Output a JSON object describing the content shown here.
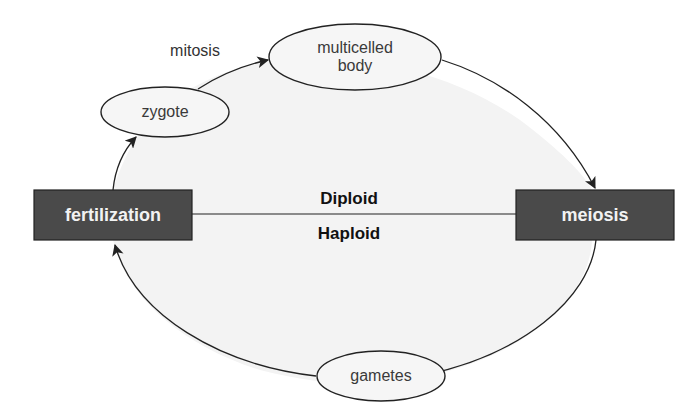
{
  "diagram": {
    "colors": {
      "background": "#ffffff",
      "cycle_fill": "#f3f3f3",
      "box_fill": "#4a4a4a",
      "box_text": "#f2f2f2",
      "line": "#222222",
      "node_fill": "#f6f6f6"
    },
    "nodes": [
      {
        "id": "zygote",
        "label": "zygote",
        "shape": "ellipse"
      },
      {
        "id": "multicelled_body",
        "label": "multicelled\nbody",
        "line1": "multicelled",
        "line2": "body",
        "shape": "ellipse"
      },
      {
        "id": "gametes",
        "label": "gametes",
        "shape": "ellipse"
      },
      {
        "id": "fertilization",
        "label": "fertilization",
        "shape": "rectangle"
      },
      {
        "id": "meiosis",
        "label": "meiosis",
        "shape": "rectangle"
      }
    ],
    "edges": [
      {
        "from": "fertilization",
        "to": "zygote"
      },
      {
        "from": "zygote",
        "to": "multicelled_body",
        "label": "mitosis"
      },
      {
        "from": "multicelled_body",
        "to": "meiosis"
      },
      {
        "from": "meiosis",
        "to": "gametes"
      },
      {
        "from": "gametes",
        "to": "fertilization"
      }
    ],
    "divider": {
      "upper_label": "Diploid",
      "lower_label": "Haploid"
    },
    "labels": {
      "mitosis": "mitosis",
      "zygote": "zygote",
      "multicelled_line1": "multicelled",
      "multicelled_line2": "body",
      "gametes": "gametes",
      "fertilization": "fertilization",
      "meiosis": "meiosis",
      "diploid": "Diploid",
      "haploid": "Haploid"
    }
  }
}
